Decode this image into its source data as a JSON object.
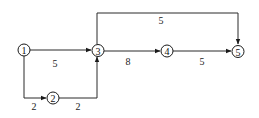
{
  "diagram": {
    "type": "activity-network",
    "nodes": [
      {
        "id": "1",
        "label": "1",
        "x": 24,
        "y": 50
      },
      {
        "id": "2",
        "label": "2",
        "x": 53,
        "y": 98
      },
      {
        "id": "3",
        "label": "3",
        "x": 98,
        "y": 50
      },
      {
        "id": "4",
        "label": "4",
        "x": 167,
        "y": 50
      },
      {
        "id": "5",
        "label": "5",
        "x": 238,
        "y": 51
      }
    ],
    "edges": [
      {
        "from": "1",
        "to": "3",
        "label": "5"
      },
      {
        "from": "1",
        "to": "2",
        "label": "2"
      },
      {
        "from": "2",
        "to": "3",
        "label": "2"
      },
      {
        "from": "3",
        "to": "4",
        "label": "8"
      },
      {
        "from": "4",
        "to": "5",
        "label": "5"
      },
      {
        "from": "3",
        "to": "5",
        "label": "5"
      }
    ]
  }
}
